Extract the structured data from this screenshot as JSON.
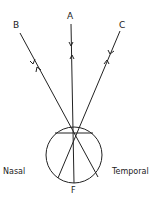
{
  "diagram": {
    "type": "eye-ray-diagram",
    "labels": {
      "ray_a": "A",
      "ray_b": "B",
      "ray_c": "C",
      "fovea": "F",
      "left_side": "Nasal",
      "right_side": "Temporal"
    },
    "eye": {
      "cx": 74,
      "cy": 155,
      "r": 28
    },
    "lens_chord": {
      "x1": 55,
      "y1": 133,
      "x2": 93,
      "y2": 133
    },
    "nodal_point": {
      "x": 73,
      "y": 140
    },
    "rays": [
      {
        "id": "A",
        "from": [
          70,
          24
        ],
        "to": [
          74,
          183
        ]
      },
      {
        "id": "B",
        "from": [
          20,
          33
        ],
        "to": [
          98,
          177
        ]
      },
      {
        "id": "C",
        "from": [
          120,
          31
        ],
        "to": [
          58,
          178
        ]
      }
    ],
    "colors": {
      "stroke": "#222222",
      "background": "#ffffff"
    }
  }
}
